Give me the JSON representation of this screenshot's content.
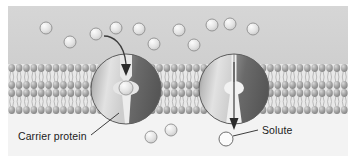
{
  "figure": {
    "background_top_color": "#d3d3d3",
    "background_bottom_color": "#f3f3f3",
    "frame_color": "#7a7a7a"
  },
  "labels": {
    "carrier_protein": "Carrier protein",
    "solute": "Solute"
  },
  "membrane": {
    "name": "phospholipid-bilayer",
    "head_color": "#9b9b9b",
    "head_highlight": "#cfcfcf",
    "tail_color": "#b8b8b8",
    "top_y": 58,
    "bottom_y": 108,
    "head_count": 46
  },
  "proteins": [
    {
      "name": "carrier-protein-closed",
      "state": "binding",
      "cx": 118,
      "cy": 83,
      "r": 35,
      "light_half_color": "#cccccc",
      "dark_half_color": "#6e6e6e",
      "channel": "occluded",
      "bound_solute": true
    },
    {
      "name": "carrier-protein-open",
      "state": "releasing",
      "cx": 226,
      "cy": 83,
      "r": 35,
      "light_half_color": "#cfcfcf",
      "dark_half_color": "#6b6b6b",
      "channel": "open",
      "bound_solute": false
    }
  ],
  "arrows": [
    {
      "name": "solute-entry-arrow",
      "direction": "down",
      "from": "extracellular",
      "to": "carrier-protein-closed"
    },
    {
      "name": "solute-exit-arrow",
      "direction": "down",
      "from": "carrier-protein-open",
      "to": "intracellular"
    }
  ],
  "solutes": {
    "fill": "#dedede",
    "stroke": "#8e8e8e",
    "radius": 6,
    "extracellular": [
      {
        "x": 38,
        "y": 22
      },
      {
        "x": 62,
        "y": 36
      },
      {
        "x": 88,
        "y": 28
      },
      {
        "x": 108,
        "y": 22
      },
      {
        "x": 131,
        "y": 23
      },
      {
        "x": 146,
        "y": 38
      },
      {
        "x": 171,
        "y": 24
      },
      {
        "x": 186,
        "y": 39
      },
      {
        "x": 204,
        "y": 19
      },
      {
        "x": 222,
        "y": 18
      },
      {
        "x": 245,
        "y": 23
      }
    ],
    "bound": [
      {
        "x": 118,
        "y": 82
      }
    ],
    "intracellular": [
      {
        "x": 143,
        "y": 131
      },
      {
        "x": 163,
        "y": 124
      }
    ],
    "labeled": {
      "x": 218,
      "y": 133
    }
  },
  "leader_lines": [
    {
      "name": "carrier-protein-leader",
      "x1": 84,
      "y1": 128,
      "x2": 112,
      "y2": 108
    },
    {
      "name": "solute-leader",
      "x1": 226,
      "y1": 130,
      "x2": 252,
      "y2": 125
    }
  ]
}
